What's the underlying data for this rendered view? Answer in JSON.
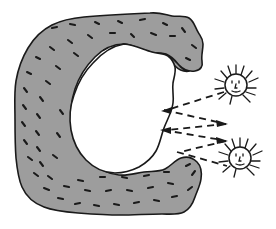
{
  "figure": {
    "title": "Light rays reflecting between suns and a C-shaped cave",
    "background_color": "#ffffff",
    "width": 276,
    "height": 229
  },
  "cave": {
    "label": "c-shaped-rock-formation",
    "fill_color": "#9d9d9d",
    "outline_color": "#1a1a1a",
    "outline_width": 1.6,
    "cavity_color": "#ffffff",
    "speckle_color": "#1a1a1a",
    "speckle_count": 62,
    "opening_side": "right"
  },
  "suns": [
    {
      "name": "upper-sun",
      "cx": 236,
      "cy": 85,
      "radius": 11,
      "ray_count": 13,
      "ray_length": 9,
      "face": {
        "eyes": 2,
        "nose": 1,
        "mouth": 1
      },
      "stroke_color": "#1a1a1a"
    },
    {
      "name": "lower-sun",
      "cx": 240,
      "cy": 158,
      "radius": 11,
      "ray_count": 13,
      "ray_length": 9,
      "face": {
        "eyes": 2,
        "nose": 1,
        "mouth": 1
      },
      "stroke_color": "#1a1a1a"
    }
  ],
  "rays": {
    "style": "dashed",
    "dash_pattern": "7 5",
    "stroke_color": "#1a1a1a",
    "stroke_width": 1.8,
    "paths": [
      {
        "name": "ray-upper-incoming",
        "from": "upper-sun",
        "direction": "left",
        "points": "224,92 164,110",
        "arrowhead": "left"
      },
      {
        "name": "ray-upper-reflected",
        "from": "cave",
        "direction": "right",
        "points": "164,110 227,123",
        "arrowhead": "right"
      },
      {
        "name": "ray-middle-incoming",
        "from": "right",
        "direction": "left",
        "points": "227,123 163,130",
        "arrowhead": "left"
      },
      {
        "name": "ray-middle-reflected",
        "from": "cave",
        "direction": "right",
        "points": "163,130 227,140",
        "arrowhead": "right"
      },
      {
        "name": "ray-lower-incoming",
        "from": "right",
        "direction": "left",
        "points": "227,140 176,152",
        "arrowhead": "left"
      },
      {
        "name": "ray-lower-to-sun",
        "from": "cave",
        "direction": "right",
        "points": "176,152 227,166",
        "arrowhead": "none"
      }
    ]
  }
}
